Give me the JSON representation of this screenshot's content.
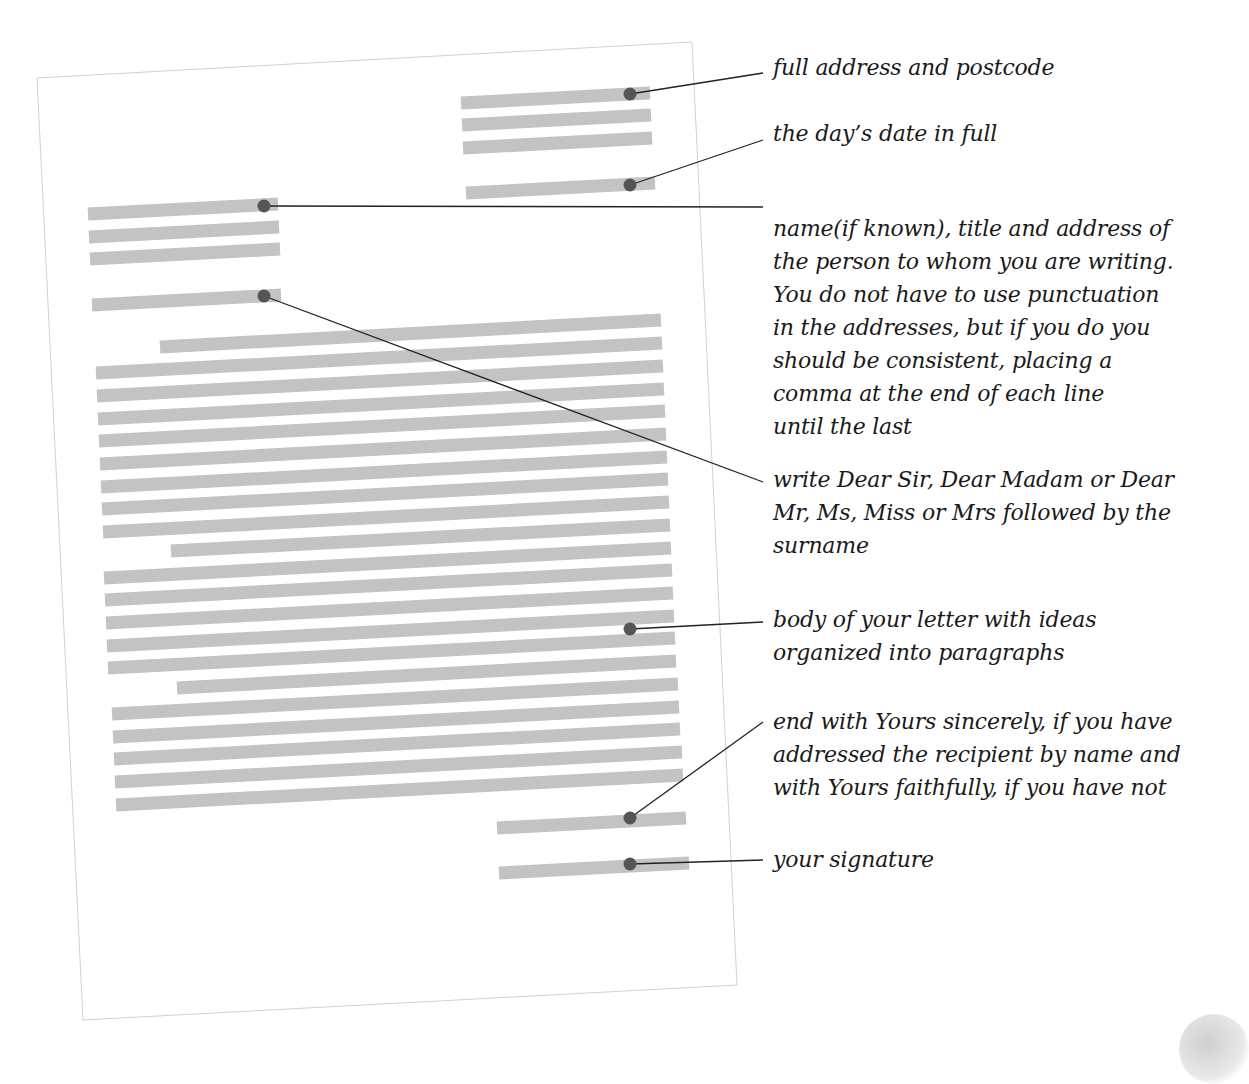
{
  "diagram": {
    "colors": {
      "bar": "#c3c3c3",
      "dot": "#555555",
      "leader": "#222222",
      "page_border": "#d0d0d0",
      "text": "#1a1a1a"
    },
    "page": {
      "corners": {
        "top_left": [
          37,
          78
        ],
        "top_right": [
          692,
          42
        ],
        "bottom_right": [
          737,
          985
        ],
        "bottom_left": [
          83,
          1020
        ]
      },
      "rotation_deg": -3.1
    },
    "annotations": [
      {
        "id": "sender-address",
        "lines": [
          "full address and postcode"
        ],
        "top": 51,
        "dot": [
          630,
          94
        ],
        "anchor": [
          763,
          73
        ]
      },
      {
        "id": "date",
        "lines": [
          "the day’s date in full"
        ],
        "top": 117,
        "dot": [
          630,
          185
        ],
        "anchor": [
          763,
          140
        ]
      },
      {
        "id": "recipient-address",
        "lines": [
          "name(if known), title and address of",
          "the person to whom you are writing.",
          "You do not have to use punctuation",
          "in the addresses, but if you do you",
          "should be consistent, placing a",
          "comma at the end of each line",
          "until the last"
        ],
        "top": 212,
        "dot": [
          264,
          206
        ],
        "anchor": [
          763,
          207
        ]
      },
      {
        "id": "salutation",
        "lines": [
          "write Dear Sir, Dear Madam or Dear",
          "Mr, Ms, Miss or Mrs followed by the",
          "surname"
        ],
        "top": 463,
        "dot": [
          264,
          296
        ],
        "anchor": [
          763,
          482
        ]
      },
      {
        "id": "body",
        "lines": [
          "body of your letter with ideas",
          "organized into paragraphs"
        ],
        "top": 603,
        "dot": [
          630,
          629
        ],
        "anchor": [
          763,
          622
        ]
      },
      {
        "id": "closing",
        "lines": [
          "end with Yours sincerely, if you have",
          "addressed the recipient by name and",
          "with Yours faithfully, if you have not"
        ],
        "top": 705,
        "dot": [
          630,
          818
        ],
        "anchor": [
          763,
          722
        ]
      },
      {
        "id": "signature",
        "lines": [
          "your signature"
        ],
        "top": 843,
        "dot": [
          630,
          864
        ],
        "anchor": [
          763,
          860
        ]
      }
    ],
    "bars": [
      {
        "group": "sender-address",
        "x1": 461,
        "y1": 103,
        "x2": 650,
        "y2": 93
      },
      {
        "group": "sender-address",
        "x1": 462,
        "y1": 125,
        "x2": 651,
        "y2": 115
      },
      {
        "group": "sender-address",
        "x1": 463,
        "y1": 148,
        "x2": 652,
        "y2": 138
      },
      {
        "group": "date",
        "x1": 466,
        "y1": 193,
        "x2": 655,
        "y2": 183
      },
      {
        "group": "recipient-address",
        "x1": 88,
        "y1": 214,
        "x2": 278,
        "y2": 204
      },
      {
        "group": "recipient-address",
        "x1": 89,
        "y1": 237,
        "x2": 279,
        "y2": 227
      },
      {
        "group": "recipient-address",
        "x1": 90,
        "y1": 259,
        "x2": 280,
        "y2": 249
      },
      {
        "group": "salutation",
        "x1": 92,
        "y1": 305,
        "x2": 281,
        "y2": 295
      },
      {
        "group": "body",
        "x1": 160,
        "y1": 347,
        "x2": 661,
        "y2": 320
      },
      {
        "group": "body",
        "x1": 96,
        "y1": 373,
        "x2": 662,
        "y2": 343
      },
      {
        "group": "body",
        "x1": 97,
        "y1": 396,
        "x2": 663,
        "y2": 366
      },
      {
        "group": "body",
        "x1": 98,
        "y1": 419,
        "x2": 664,
        "y2": 389
      },
      {
        "group": "body",
        "x1": 99,
        "y1": 441,
        "x2": 665,
        "y2": 411
      },
      {
        "group": "body",
        "x1": 100,
        "y1": 464,
        "x2": 666,
        "y2": 434
      },
      {
        "group": "body",
        "x1": 101,
        "y1": 487,
        "x2": 667,
        "y2": 457
      },
      {
        "group": "body",
        "x1": 102,
        "y1": 509,
        "x2": 668,
        "y2": 479
      },
      {
        "group": "body",
        "x1": 103,
        "y1": 532,
        "x2": 669,
        "y2": 502
      },
      {
        "group": "body",
        "x1": 171,
        "y1": 551,
        "x2": 670,
        "y2": 525
      },
      {
        "group": "body",
        "x1": 104,
        "y1": 578,
        "x2": 671,
        "y2": 548
      },
      {
        "group": "body",
        "x1": 105,
        "y1": 600,
        "x2": 672,
        "y2": 570
      },
      {
        "group": "body",
        "x1": 106,
        "y1": 623,
        "x2": 673,
        "y2": 593
      },
      {
        "group": "body",
        "x1": 107,
        "y1": 646,
        "x2": 674,
        "y2": 616
      },
      {
        "group": "body",
        "x1": 108,
        "y1": 668,
        "x2": 675,
        "y2": 638
      },
      {
        "group": "body",
        "x1": 177,
        "y1": 688,
        "x2": 676,
        "y2": 661
      },
      {
        "group": "body",
        "x1": 112,
        "y1": 714,
        "x2": 678,
        "y2": 684
      },
      {
        "group": "body",
        "x1": 113,
        "y1": 737,
        "x2": 679,
        "y2": 707
      },
      {
        "group": "body",
        "x1": 114,
        "y1": 759,
        "x2": 680,
        "y2": 729
      },
      {
        "group": "body",
        "x1": 115,
        "y1": 782,
        "x2": 682,
        "y2": 752
      },
      {
        "group": "body",
        "x1": 116,
        "y1": 805,
        "x2": 683,
        "y2": 775
      },
      {
        "group": "closing",
        "x1": 497,
        "y1": 828,
        "x2": 686,
        "y2": 818
      },
      {
        "group": "signature",
        "x1": 499,
        "y1": 873,
        "x2": 689,
        "y2": 863
      }
    ]
  }
}
